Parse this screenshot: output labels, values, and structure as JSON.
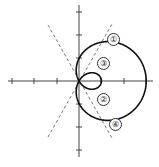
{
  "figure": {
    "type": "polar-curve",
    "colors": {
      "curve": "#111111",
      "axis": "#444444",
      "dashed": "#555555"
    },
    "labels": [
      {
        "id": "1",
        "text": "①"
      },
      {
        "id": "3",
        "text": "③"
      },
      {
        "id": "2",
        "text": "②"
      },
      {
        "id": "4",
        "text": "④"
      }
    ]
  }
}
